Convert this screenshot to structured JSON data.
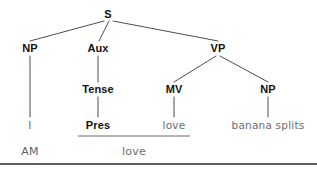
{
  "diagram": {
    "type": "syntax-tree",
    "title": "",
    "nodes": [
      {
        "id": "S",
        "label": "S",
        "x": 108,
        "y": 14,
        "style": "node"
      },
      {
        "id": "NP1",
        "label": "NP",
        "x": 30,
        "y": 48,
        "style": "node"
      },
      {
        "id": "AUX",
        "label": "Aux",
        "x": 98,
        "y": 48,
        "style": "node"
      },
      {
        "id": "VP",
        "label": "VP",
        "x": 218,
        "y": 48,
        "style": "node"
      },
      {
        "id": "TENSE",
        "label": "Tense",
        "x": 98,
        "y": 89,
        "style": "node"
      },
      {
        "id": "MV",
        "label": "MV",
        "x": 174,
        "y": 89,
        "style": "node"
      },
      {
        "id": "NP2",
        "label": "NP",
        "x": 268,
        "y": 89,
        "style": "node"
      },
      {
        "id": "PRES",
        "label": "Pres",
        "x": 98,
        "y": 125,
        "style": "terminal-bold"
      },
      {
        "id": "LOVE1",
        "label": "love",
        "x": 174,
        "y": 125,
        "style": "terminal"
      },
      {
        "id": "BANANA",
        "label": "banana splits",
        "x": 268,
        "y": 125,
        "style": "terminal"
      },
      {
        "id": "I",
        "label": "I",
        "x": 30,
        "y": 125,
        "style": "terminal"
      },
      {
        "id": "AM",
        "label": "AM",
        "x": 30,
        "y": 151,
        "style": "subject-word"
      },
      {
        "id": "LOVE2",
        "label": "love",
        "x": 134,
        "y": 151,
        "style": "merged-word"
      }
    ],
    "edges": [
      {
        "from": "S",
        "to": "NP1",
        "x1": 104,
        "y1": 21,
        "x2": 30,
        "y2": 41
      },
      {
        "from": "S",
        "to": "AUX",
        "x1": 109,
        "y1": 21,
        "x2": 99,
        "y2": 41
      },
      {
        "from": "S",
        "to": "VP",
        "x1": 113,
        "y1": 21,
        "x2": 218,
        "y2": 41
      },
      {
        "from": "NP1",
        "to": "I",
        "x1": 30,
        "y1": 56,
        "x2": 30,
        "y2": 117
      },
      {
        "from": "AUX",
        "to": "TENSE",
        "x1": 98,
        "y1": 56,
        "x2": 98,
        "y2": 82
      },
      {
        "from": "TENSE",
        "to": "PRES",
        "x1": 98,
        "y1": 97,
        "x2": 98,
        "y2": 117
      },
      {
        "from": "VP",
        "to": "MV",
        "x1": 216,
        "y1": 56,
        "x2": 174,
        "y2": 82
      },
      {
        "from": "VP",
        "to": "NP2",
        "x1": 220,
        "y1": 56,
        "x2": 268,
        "y2": 82
      },
      {
        "from": "MV",
        "to": "LOVE1",
        "x1": 174,
        "y1": 97,
        "x2": 174,
        "y2": 117
      },
      {
        "from": "NP2",
        "to": "BANANA",
        "x1": 268,
        "y1": 97,
        "x2": 268,
        "y2": 117
      }
    ],
    "merger_line": {
      "x1": 78,
      "y1": 136,
      "x2": 190,
      "y2": 136
    },
    "bottom_rule": {
      "x1": 0,
      "y1": 164,
      "x2": 317,
      "y2": 164
    },
    "colors": {
      "stroke": "#4d4d4d",
      "node_text": "#111111",
      "terminal_text": "#6e6e6e",
      "rule": "#2b2b2b",
      "background": "#ffffff"
    },
    "sentence": "I AM love banana splits"
  }
}
